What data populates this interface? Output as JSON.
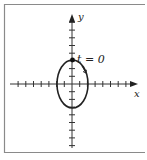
{
  "figure": {
    "type": "parametric-ellipse",
    "axes": {
      "x_label": "x",
      "y_label": "y",
      "x_ticks_each_side": 7,
      "y_ticks_above": 8,
      "y_ticks_below": 8
    },
    "curve": {
      "shape": "ellipse",
      "semi_axis_x": 2,
      "semi_axis_y": 3,
      "direction": "clockwise"
    },
    "start_point": {
      "label": "t = 0",
      "position": [
        0,
        3
      ]
    },
    "colors": {
      "frame": "#8a8a8a",
      "axes": "#333333",
      "curve": "#222222"
    }
  }
}
